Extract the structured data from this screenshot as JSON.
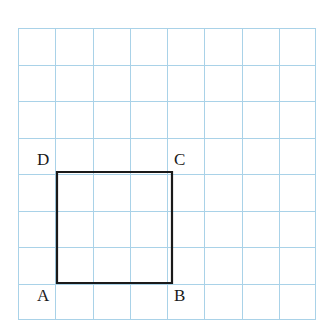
{
  "figure": {
    "background_color": "#ffffff"
  },
  "grid": {
    "line_color": "#a9d2e8",
    "columns": 8,
    "rows": 8,
    "cell_width": 37.3,
    "cell_height": 36.5,
    "origin_x": 18,
    "origin_y": 28,
    "width": 298,
    "height": 292
  },
  "shape": {
    "name": "square-abcd",
    "type": "square",
    "stroke_color": "#1a1a1a",
    "stroke_width": 2.2,
    "fill": "none",
    "side_cells": 3,
    "points": "57,172 172,172 172,283 57,283",
    "vertices": [
      {
        "id": "A",
        "label": "A",
        "x": 57,
        "y": 283,
        "position": "bottom-left"
      },
      {
        "id": "B",
        "label": "B",
        "x": 172,
        "y": 283,
        "position": "bottom-right"
      },
      {
        "id": "C",
        "label": "C",
        "x": 172,
        "y": 172,
        "position": "top-right"
      },
      {
        "id": "D",
        "label": "D",
        "x": 57,
        "y": 172,
        "position": "top-left"
      }
    ]
  },
  "labels": {
    "A": "A",
    "B": "B",
    "C": "C",
    "D": "D"
  }
}
